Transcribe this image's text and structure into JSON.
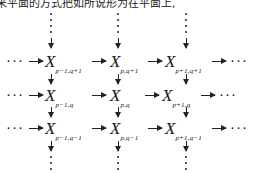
{
  "caption": "来平面的方式把如所说形为在平面上,",
  "diagram": {
    "left_ellipsis": "···",
    "right_ellipsis": "···",
    "rows": [
      {
        "cells": [
          {
            "base": "X",
            "sub": "p−1,q+1"
          },
          {
            "base": "X",
            "sub": "p,q+1"
          },
          {
            "base": "X",
            "sub": "p+1,q+1"
          }
        ]
      },
      {
        "cells": [
          {
            "base": "X",
            "sub": "p−1,q"
          },
          {
            "base": "X",
            "sub": "p,q"
          },
          {
            "base": "X",
            "sub": "p+1,q"
          }
        ]
      },
      {
        "cells": [
          {
            "base": "X",
            "sub": "p−1,q−1"
          },
          {
            "base": "X",
            "sub": "p,q−1"
          },
          {
            "base": "X",
            "sub": "p+1,q−1"
          }
        ]
      }
    ]
  }
}
